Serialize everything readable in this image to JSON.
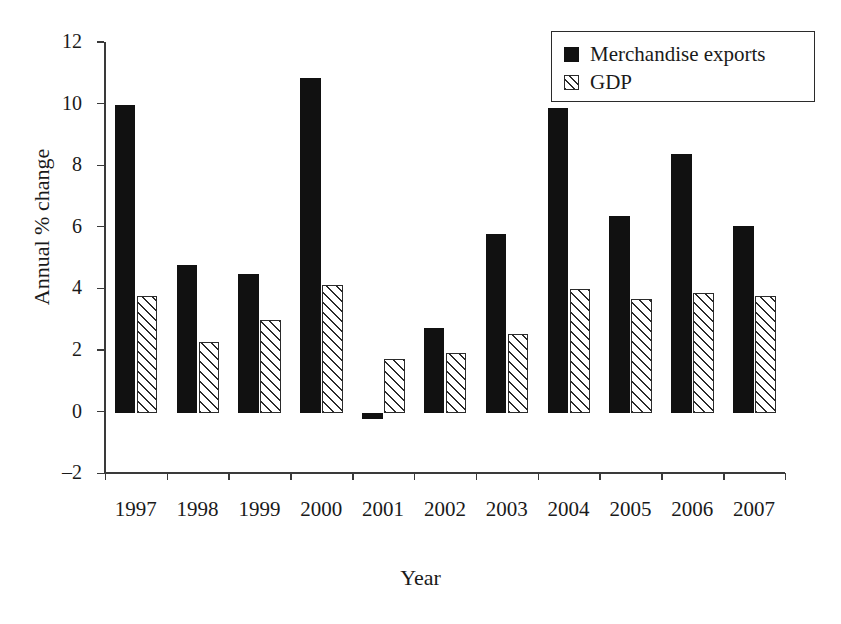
{
  "chart_data": {
    "type": "bar",
    "title": "",
    "xlabel": "Year",
    "ylabel": "Annual % change",
    "categories": [
      "1997",
      "1998",
      "1999",
      "2000",
      "2001",
      "2002",
      "2003",
      "2004",
      "2005",
      "2006",
      "2007"
    ],
    "series": [
      {
        "name": "Merchandise exports",
        "values": [
          10.0,
          4.8,
          4.5,
          10.85,
          -0.2,
          2.75,
          5.8,
          9.9,
          6.4,
          8.4,
          6.05
        ],
        "style": "solid-black",
        "color": "#111111"
      },
      {
        "name": "GDP",
        "values": [
          3.8,
          2.3,
          3.0,
          4.15,
          1.75,
          1.95,
          2.55,
          4.0,
          3.7,
          3.9,
          3.8
        ],
        "style": "diagonal-hatch",
        "color": "#2b2b2b"
      }
    ],
    "ylim": [
      -2,
      12
    ],
    "yticks": [
      -2,
      0,
      2,
      4,
      6,
      8,
      10,
      12
    ],
    "ytick_labels": [
      "–2",
      "0",
      "2",
      "4",
      "6",
      "8",
      "10",
      "12"
    ],
    "grid": false,
    "legend_position": "top-right"
  },
  "legend": {
    "items": [
      {
        "label": "Merchandise exports",
        "swatch": "solid-black-square"
      },
      {
        "label": "GDP",
        "swatch": "hatched-square"
      }
    ]
  }
}
